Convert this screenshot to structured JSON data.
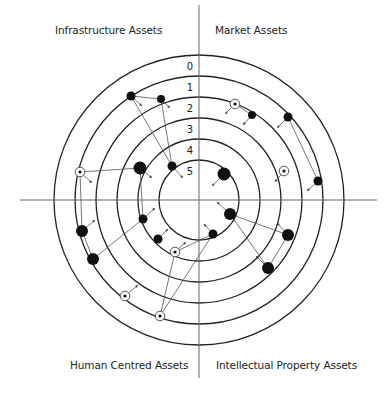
{
  "diagram": {
    "center": [
      199,
      200
    ],
    "ring_radii": [
      145,
      124,
      103,
      82,
      61,
      40
    ],
    "ring_labels": [
      "0",
      "1",
      "2",
      "3",
      "4",
      "5"
    ],
    "axes": {
      "h": [
        20,
        377
      ],
      "v": [
        5,
        378
      ]
    },
    "colors": {
      "line": "#222222",
      "node": "#111111",
      "connector": "#555555"
    }
  },
  "quadrants": {
    "top_left": "Infrastructure Assets",
    "top_right": "Market Assets",
    "bottom_left": "Human Centred Assets",
    "bottom_right": "Intellectual Property Assets"
  },
  "nodes": [
    {
      "id": "n1",
      "x": 131,
      "y": 96,
      "r": 4.5,
      "type": "filled",
      "arrow": [
        142,
        106
      ]
    },
    {
      "id": "n2",
      "x": 161,
      "y": 99,
      "r": 4,
      "type": "filled",
      "arrow": [
        170,
        108
      ]
    },
    {
      "id": "n3",
      "x": 140,
      "y": 168,
      "r": 6.5,
      "type": "filled",
      "arrow": [
        152,
        178
      ]
    },
    {
      "id": "n4",
      "x": 172,
      "y": 166,
      "r": 4.5,
      "type": "filled",
      "arrow": [
        183,
        178
      ]
    },
    {
      "id": "n5",
      "x": 80,
      "y": 172,
      "r": 3,
      "type": "ringed",
      "arrow": [
        92,
        183
      ]
    },
    {
      "id": "n6",
      "x": 82,
      "y": 231,
      "r": 6,
      "type": "filled",
      "arrow": [
        95,
        220
      ]
    },
    {
      "id": "n7",
      "x": 93,
      "y": 259,
      "r": 6,
      "type": "filled",
      "arrow": [
        0,
        0
      ]
    },
    {
      "id": "n8",
      "x": 143,
      "y": 219,
      "r": 4.5,
      "type": "filled",
      "arrow": [
        155,
        208
      ]
    },
    {
      "id": "n9",
      "x": 158,
      "y": 239,
      "r": 4.5,
      "type": "filled",
      "arrow": [
        168,
        229
      ]
    },
    {
      "id": "n10",
      "x": 175,
      "y": 252,
      "r": 3,
      "type": "ringed",
      "arrow": [
        186,
        242
      ]
    },
    {
      "id": "n11",
      "x": 125,
      "y": 296,
      "r": 3,
      "type": "ringed",
      "arrow": [
        138,
        285
      ]
    },
    {
      "id": "n12",
      "x": 160,
      "y": 316,
      "r": 3,
      "type": "ringed",
      "arrow": [
        0,
        0
      ]
    },
    {
      "id": "n13",
      "x": 213,
      "y": 234,
      "r": 4.5,
      "type": "filled",
      "arrow": [
        204,
        224
      ]
    },
    {
      "id": "n14",
      "x": 230,
      "y": 214,
      "r": 6,
      "type": "filled",
      "arrow": [
        217,
        202
      ]
    },
    {
      "id": "n15",
      "x": 288,
      "y": 235,
      "r": 6,
      "type": "filled",
      "arrow": [
        277,
        223
      ]
    },
    {
      "id": "n16",
      "x": 268,
      "y": 268,
      "r": 6,
      "type": "filled",
      "arrow": [
        256,
        256
      ]
    },
    {
      "id": "n17",
      "x": 224,
      "y": 174,
      "r": 6.5,
      "type": "filled",
      "arrow": [
        212,
        186
      ]
    },
    {
      "id": "n18",
      "x": 235,
      "y": 104,
      "r": 3,
      "type": "ringed",
      "arrow": [
        225,
        114
      ]
    },
    {
      "id": "n19",
      "x": 252,
      "y": 115,
      "r": 4,
      "type": "filled",
      "arrow": [
        243,
        125
      ]
    },
    {
      "id": "n20",
      "x": 288,
      "y": 117,
      "r": 4.5,
      "type": "filled",
      "arrow": [
        277,
        128
      ]
    },
    {
      "id": "n21",
      "x": 284,
      "y": 171,
      "r": 3,
      "type": "ringed",
      "arrow": [
        275,
        182
      ]
    },
    {
      "id": "n22",
      "x": 318,
      "y": 181,
      "r": 4.5,
      "type": "filled",
      "arrow": [
        307,
        191
      ]
    }
  ],
  "links": [
    [
      "n1",
      "n2"
    ],
    [
      "n1",
      "n4"
    ],
    [
      "n2",
      "n4"
    ],
    [
      "n5",
      "n3"
    ],
    [
      "n5",
      "n6"
    ],
    [
      "n6",
      "n7"
    ],
    [
      "n7",
      "n8"
    ],
    [
      "n3",
      "n8"
    ],
    [
      "n10",
      "n13"
    ],
    [
      "n12",
      "n10"
    ],
    [
      "n12",
      "n13"
    ],
    [
      "n14",
      "n15"
    ],
    [
      "n14",
      "n16"
    ],
    [
      "n15",
      "n16"
    ],
    [
      "n18",
      "n19"
    ],
    [
      "n20",
      "n22"
    ]
  ]
}
